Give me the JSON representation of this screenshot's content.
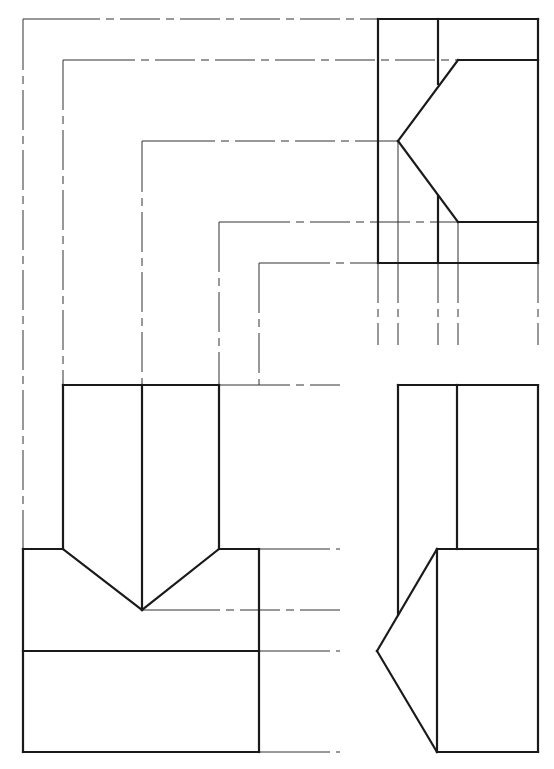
{
  "figure": {
    "views": [
      "front-view",
      "side-view",
      "top-view"
    ],
    "colors": {
      "line": "#1a1a1a",
      "construction": "#333333",
      "background": "#ffffff"
    }
  },
  "top_view": {
    "solid": [
      [
        378,
        19,
        538,
        19
      ],
      [
        378,
        19,
        378,
        263
      ],
      [
        538,
        19,
        538,
        263
      ],
      [
        378,
        263,
        538,
        263
      ],
      [
        438,
        19,
        438,
        84
      ],
      [
        458,
        60,
        538,
        60
      ],
      [
        458,
        60,
        398,
        141
      ],
      [
        398,
        141,
        458,
        222
      ],
      [
        458,
        222,
        538,
        222
      ],
      [
        438,
        196,
        438,
        263
      ]
    ],
    "thin": [
      [
        398,
        141,
        398,
        263
      ],
      [
        458,
        222,
        458,
        263
      ]
    ]
  },
  "front_view": {
    "solid": [
      [
        63,
        385,
        219,
        385
      ],
      [
        63,
        385,
        63,
        549
      ],
      [
        219,
        385,
        219,
        549
      ],
      [
        142,
        385,
        142,
        610
      ],
      [
        23,
        549,
        63,
        549
      ],
      [
        219,
        549,
        259,
        549
      ],
      [
        23,
        549,
        23,
        752
      ],
      [
        259,
        549,
        259,
        752
      ],
      [
        63,
        549,
        142,
        610
      ],
      [
        219,
        549,
        142,
        610
      ],
      [
        23,
        651,
        259,
        651
      ],
      [
        23,
        752,
        259,
        752
      ]
    ]
  },
  "side_view": {
    "solid": [
      [
        398,
        385,
        538,
        385
      ],
      [
        398,
        385,
        398,
        615
      ],
      [
        538,
        385,
        538,
        752
      ],
      [
        457,
        385,
        457,
        549
      ],
      [
        437,
        549,
        538,
        549
      ],
      [
        437,
        549,
        437,
        752
      ],
      [
        437,
        752,
        538,
        752
      ],
      [
        437,
        549,
        377,
        651
      ],
      [
        377,
        651,
        437,
        752
      ]
    ]
  },
  "projection_lines": {
    "thin": [
      [
        23,
        19,
        60,
        19
      ],
      [
        63,
        60,
        95,
        60
      ],
      [
        142,
        141,
        175,
        141
      ],
      [
        219,
        222,
        250,
        222
      ],
      [
        259,
        263,
        290,
        263
      ],
      [
        360,
        141,
        398,
        141
      ],
      [
        23,
        19,
        23,
        30
      ],
      [
        63,
        60,
        63,
        70
      ],
      [
        142,
        141,
        142,
        152
      ],
      [
        219,
        222,
        219,
        232
      ],
      [
        259,
        263,
        259,
        273
      ],
      [
        219,
        385,
        250,
        385
      ],
      [
        259,
        549,
        290,
        549
      ],
      [
        142,
        610,
        180,
        610
      ],
      [
        259,
        651,
        290,
        651
      ],
      [
        259,
        752,
        290,
        752
      ]
    ],
    "chain": [
      [
        60,
        19,
        378,
        19
      ],
      [
        95,
        60,
        458,
        60
      ],
      [
        175,
        141,
        360,
        141
      ],
      [
        250,
        222,
        458,
        222
      ],
      [
        290,
        263,
        378,
        263
      ],
      [
        23,
        30,
        23,
        549
      ],
      [
        63,
        70,
        63,
        385
      ],
      [
        142,
        152,
        142,
        385
      ],
      [
        219,
        232,
        219,
        385
      ],
      [
        259,
        273,
        259,
        385
      ],
      [
        250,
        385,
        340,
        385
      ],
      [
        290,
        549,
        340,
        549
      ],
      [
        180,
        610,
        340,
        610
      ],
      [
        290,
        651,
        340,
        651
      ],
      [
        290,
        752,
        340,
        752
      ],
      [
        378,
        263,
        378,
        345
      ],
      [
        398,
        263,
        398,
        345
      ],
      [
        438,
        263,
        438,
        345
      ],
      [
        458,
        263,
        458,
        345
      ],
      [
        538,
        263,
        538,
        345
      ]
    ]
  }
}
